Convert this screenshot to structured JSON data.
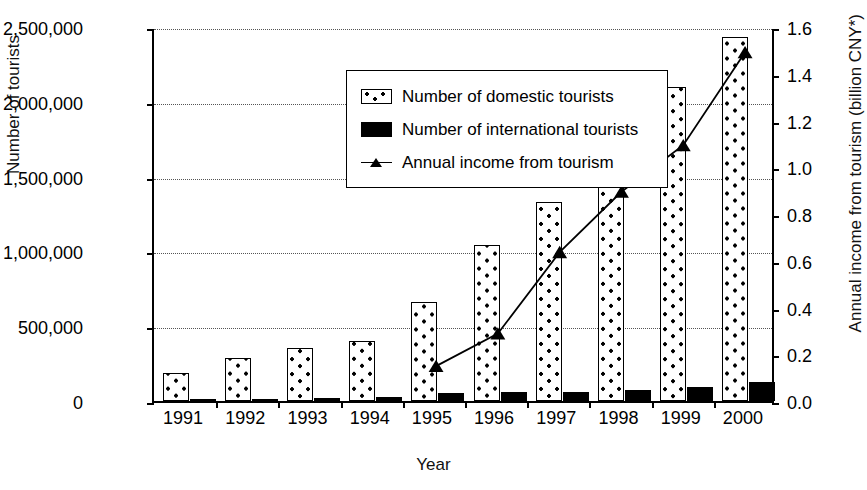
{
  "chart_data": {
    "type": "bar",
    "title": "",
    "xlabel": "Year",
    "ylabel": "Number of tourists",
    "y2label": "Annual income from tourism (billion CNY*)",
    "categories": [
      "1991",
      "1992",
      "1993",
      "1994",
      "1995",
      "1996",
      "1997",
      "1998",
      "1999",
      "2000"
    ],
    "ylim": [
      0,
      2500000
    ],
    "y2lim": [
      0,
      1.6
    ],
    "grid": true,
    "legend_position": "upper-left-inside",
    "yticks": [
      "0",
      "500,000",
      "1,000,000",
      "1,500,000",
      "2,000,000",
      "2,500,000"
    ],
    "ytick_values": [
      0,
      500000,
      1000000,
      1500000,
      2000000,
      2500000
    ],
    "y2ticks": [
      "0.0",
      "0.2",
      "0.4",
      "0.6",
      "0.8",
      "1.0",
      "1.2",
      "1.4",
      "1.6"
    ],
    "y2tick_values": [
      0.0,
      0.2,
      0.4,
      0.6,
      0.8,
      1.0,
      1.2,
      1.4,
      1.6
    ],
    "series": [
      {
        "name": "Number of domestic tourists",
        "type": "bar",
        "axis": "left",
        "style": "dotted-fill",
        "values": [
          185000,
          285000,
          355000,
          400000,
          665000,
          1040000,
          1330000,
          1510000,
          2100000,
          2430000
        ]
      },
      {
        "name": "Number of international tourists",
        "type": "bar",
        "axis": "left",
        "style": "solid-black",
        "values": [
          8000,
          12000,
          20000,
          25000,
          55000,
          58000,
          62000,
          75000,
          95000,
          125000
        ]
      },
      {
        "name": "Annual income from tourism",
        "type": "line",
        "axis": "right",
        "marker": "triangle",
        "x": [
          "1995",
          "1996",
          "1997",
          "1998",
          "1999",
          "2000"
        ],
        "values": [
          0.15,
          0.29,
          0.64,
          0.9,
          1.1,
          1.5
        ]
      }
    ]
  },
  "legend": {
    "items": [
      {
        "label": "Number of domestic tourists",
        "swatch": "dotted-bar-swatch"
      },
      {
        "label": "Number of international tourists",
        "swatch": "black-bar-swatch"
      },
      {
        "label": "Annual income from tourism",
        "swatch": "line-triangle-swatch"
      }
    ]
  },
  "axes": {
    "left_title": "Number of tourists",
    "right_title": "Annual income from tourism (billion CNY*)",
    "bottom_title": "Year"
  }
}
